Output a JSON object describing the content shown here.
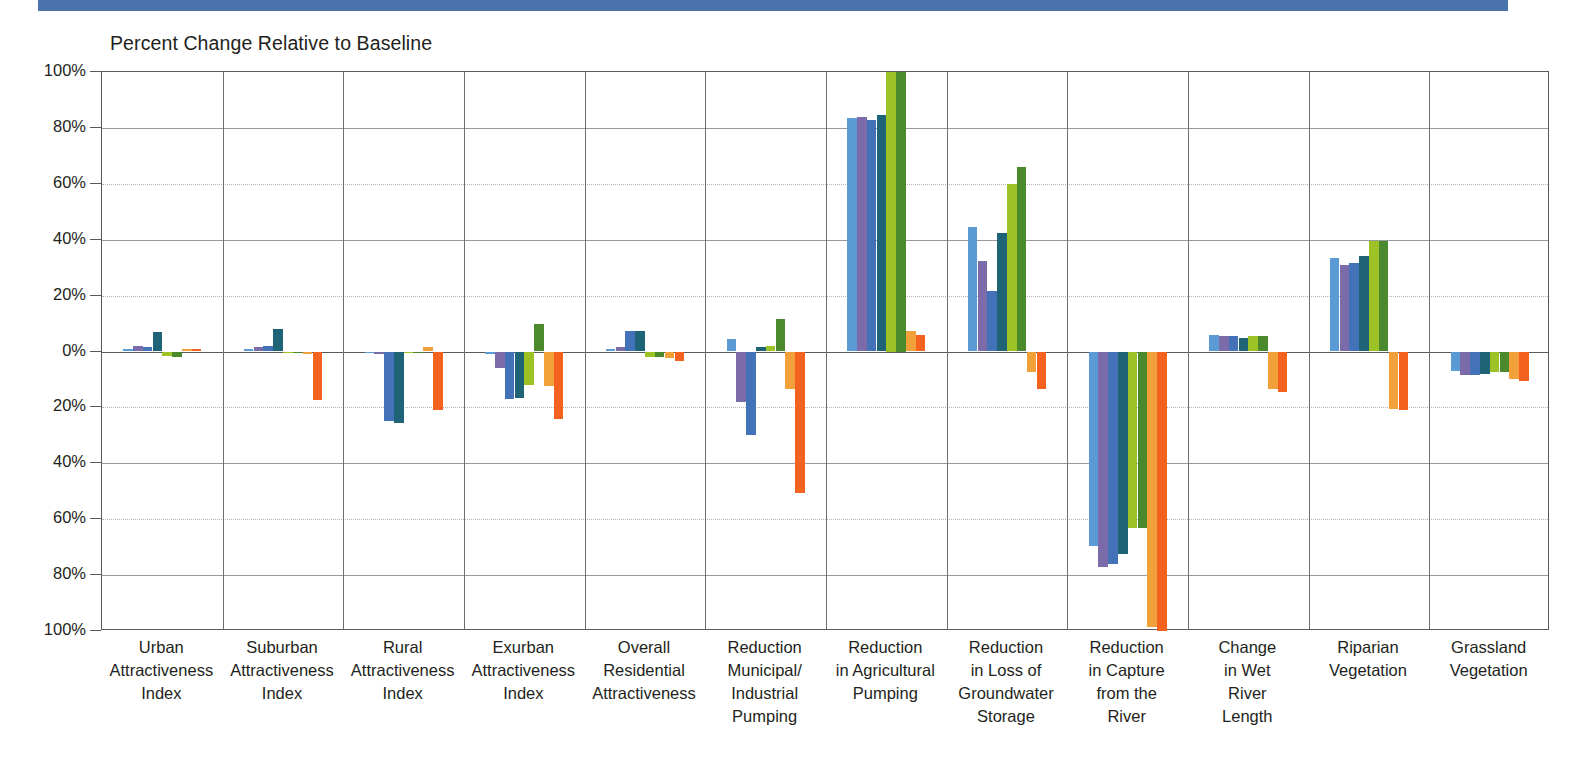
{
  "page": {
    "band_color": "#4a72ab"
  },
  "chart_data": {
    "type": "bar",
    "title": "Percent Change Relative to Baseline",
    "xlabel": "",
    "ylabel": "",
    "ylim": [
      -100,
      100
    ],
    "ytick_values": [
      100,
      80,
      60,
      40,
      20,
      0,
      -20,
      -40,
      -60,
      -80,
      -100
    ],
    "ytick_labels": [
      "100%",
      "80%",
      "60%",
      "40%",
      "20%",
      "0%",
      "20%",
      "40%",
      "60%",
      "80%",
      "100%"
    ],
    "grid": true,
    "legend": "none",
    "series_colors": [
      "#5b9bd5",
      "#7b6ba8",
      "#4472b8",
      "#1f6377",
      "#9cc226",
      "#4a8a2c",
      "#f2a13a",
      "#f4621f"
    ],
    "series_names": [
      "Series 1",
      "Series 2",
      "Series 3",
      "Series 4",
      "Series 5",
      "Series 6",
      "Series 7",
      "Series 8"
    ],
    "categories": [
      "Urban Attractiveness Index",
      "Suburban Attractiveness Index",
      "Rural Attractiveness Index",
      "Exurban Attractiveness Index",
      "Overall Residential Attractiveness",
      "Reduction Municipal/ Industrial Pumping",
      "Reduction in Agricultural Pumping",
      "Reduction in Loss of Groundwater Storage",
      "Reduction in Capture from the River",
      "Change in Wet River Length",
      "Riparian Vegetation",
      "Grassland Vegetation"
    ],
    "category_label_lines": [
      [
        "Urban",
        "Attractiveness",
        "Index"
      ],
      [
        "Suburban",
        "Attractiveness",
        "Index"
      ],
      [
        "Rural",
        "Attractiveness",
        "Index"
      ],
      [
        "Exurban",
        "Attractiveness",
        "Index"
      ],
      [
        "Overall",
        "Residential",
        "Attractiveness"
      ],
      [
        "Reduction",
        "Municipal/",
        "Industrial",
        "Pumping"
      ],
      [
        "Reduction",
        "in Agricultural",
        "Pumping"
      ],
      [
        "Reduction",
        "in Loss of",
        "Groundwater",
        "Storage"
      ],
      [
        "Reduction",
        "in Capture",
        "from the",
        "River"
      ],
      [
        "Change",
        "in Wet",
        "River",
        "Length"
      ],
      [
        "Riparian",
        "Vegetation"
      ],
      [
        "Grassland",
        "Vegetation"
      ]
    ],
    "values": [
      [
        1.0,
        2.0,
        1.5,
        7.0,
        -1.5,
        -2.0,
        1.0,
        0.8
      ],
      [
        1.0,
        1.5,
        2.0,
        8.0,
        0.0,
        0.0,
        -1.0,
        -17.5
      ],
      [
        0.0,
        -1.0,
        -25.0,
        -25.5,
        0.0,
        0.0,
        1.5,
        -21.0
      ],
      [
        -1.0,
        -6.0,
        -17.0,
        -16.5,
        -12.0,
        10.0,
        -12.5,
        -24.0
      ],
      [
        1.0,
        1.5,
        7.5,
        7.5,
        -2.0,
        -2.0,
        -2.5,
        -3.5
      ],
      [
        4.5,
        -18.0,
        -30.0,
        1.5,
        2.0,
        11.5,
        -13.5,
        -50.5
      ],
      [
        83.5,
        84.0,
        83.0,
        84.5,
        100.0,
        100.0,
        7.5,
        6.0
      ],
      [
        44.5,
        32.5,
        21.5,
        42.5,
        60.0,
        66.0,
        -7.5,
        -13.5
      ],
      [
        -69.5,
        -77.0,
        -76.0,
        -72.5,
        -63.0,
        -63.0,
        -98.5,
        -100.0
      ],
      [
        6.0,
        5.5,
        5.5,
        5.0,
        5.5,
        5.5,
        -13.5,
        -14.5
      ],
      [
        33.5,
        31.0,
        31.5,
        34.0,
        39.5,
        39.5,
        -20.5,
        -21.0
      ],
      [
        -7.0,
        -8.5,
        -8.5,
        -8.0,
        -7.5,
        -7.5,
        -10.0,
        -10.5
      ]
    ]
  }
}
